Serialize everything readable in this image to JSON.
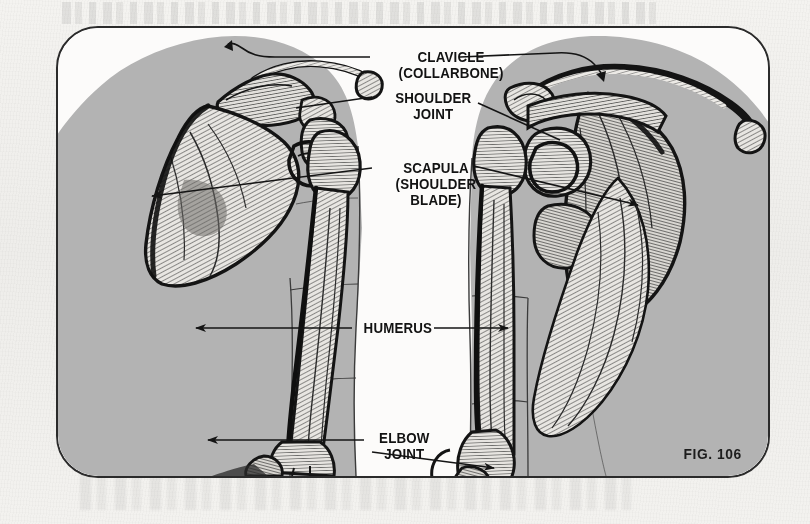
{
  "figure": {
    "caption": "FIG. 106",
    "background_color": "#f2f1ee",
    "panel_border_color": "#2b2b2b",
    "body_fill_color": "#b3b3b3",
    "ink_color": "#1a1a1a"
  },
  "labels": [
    {
      "id": "clavicle",
      "line1": "CLAVICLE",
      "line2": "(COLLARBONE)"
    },
    {
      "id": "shoulder-joint",
      "line1": "SHOULDER",
      "line2": "JOINT"
    },
    {
      "id": "scapula",
      "line1": "SCAPULA",
      "line2": "(SHOULDER"
    },
    {
      "id": "scapula-cont",
      "line1": "BLADE)",
      "line2": ""
    },
    {
      "id": "humerus",
      "line1": "HUMERUS",
      "line2": ""
    },
    {
      "id": "elbow-joint",
      "line1": "ELBOW",
      "line2": "JOINT"
    }
  ],
  "anatomy": {
    "views": [
      {
        "id": "left-view",
        "description": "anterior shoulder and arm skeleton in gray torso silhouette"
      },
      {
        "id": "right-view",
        "description": "posterior shoulder and arm skeleton in gray torso silhouette"
      }
    ],
    "bones": [
      "clavicle",
      "scapula",
      "humerus",
      "radius",
      "ulna"
    ]
  }
}
